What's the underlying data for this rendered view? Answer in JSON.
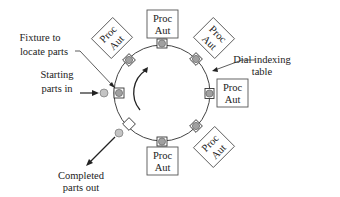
{
  "diagram": {
    "station_label_line1": "Proc",
    "station_label_line2": "Aut",
    "stations": [
      {
        "id": "top",
        "line1": "Proc",
        "line2": "Aut"
      },
      {
        "id": "upper-right",
        "line1": "Proc",
        "line2": "Aut"
      },
      {
        "id": "right",
        "line1": "Proc",
        "line2": "Aut"
      },
      {
        "id": "lower-right",
        "line1": "Proc",
        "line2": "Aut"
      },
      {
        "id": "bottom",
        "line1": "Proc",
        "line2": "Aut"
      },
      {
        "id": "upper-left",
        "line1": "Proc",
        "line2": "Aut"
      }
    ],
    "labels": {
      "fixture_line1": "Fixture to",
      "fixture_line2": "locate parts",
      "starting_line1": "Starting",
      "starting_line2": "parts in",
      "dial_line1": "Dial indexing",
      "dial_line2": "table",
      "completed_line1": "Completed",
      "completed_line2": "parts out"
    },
    "colors": {
      "line": "#333333",
      "fixture_fill": "#9a9a9a",
      "part_fill": "#c4c4c4",
      "box_fill": "#ffffff"
    }
  }
}
